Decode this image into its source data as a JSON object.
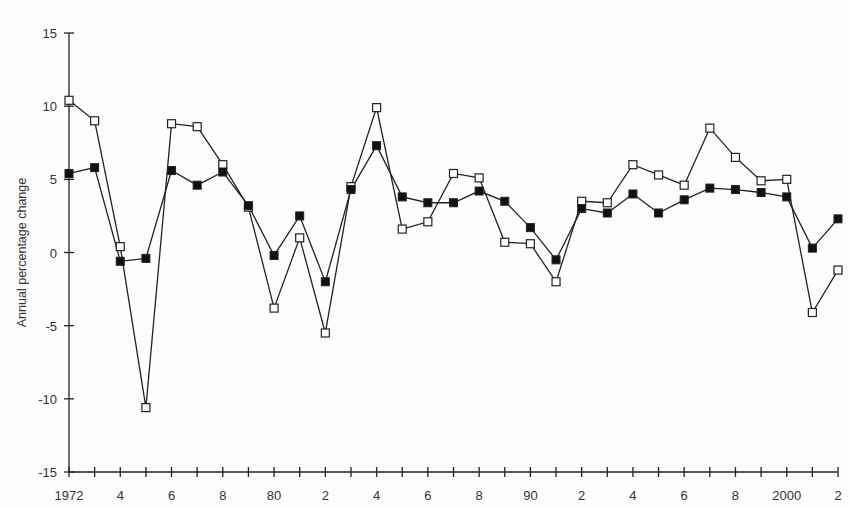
{
  "chart_data": {
    "type": "line",
    "title": "",
    "xlabel": "",
    "ylabel": "Annual percentage change",
    "x": [
      1972,
      1973,
      1974,
      1975,
      1976,
      1977,
      1978,
      1979,
      1980,
      1981,
      1982,
      1983,
      1984,
      1985,
      1986,
      1987,
      1988,
      1989,
      1990,
      1991,
      1992,
      1993,
      1994,
      1995,
      1996,
      1997,
      1998,
      1999,
      2000,
      2001,
      2002
    ],
    "xlim": [
      1972,
      2002
    ],
    "ylim": [
      -15,
      15
    ],
    "yticks": [
      15,
      10,
      5,
      0,
      -5,
      -10,
      -15
    ],
    "ytick_labels": [
      "15",
      "10",
      "5",
      "0",
      "-5",
      "-10",
      "-15"
    ],
    "xtick_labels": [
      {
        "x": 1972,
        "label": "1972"
      },
      {
        "x": 1974,
        "label": "4"
      },
      {
        "x": 1976,
        "label": "6"
      },
      {
        "x": 1978,
        "label": "8"
      },
      {
        "x": 1980,
        "label": "80"
      },
      {
        "x": 1982,
        "label": "2"
      },
      {
        "x": 1984,
        "label": "4"
      },
      {
        "x": 1986,
        "label": "6"
      },
      {
        "x": 1988,
        "label": "8"
      },
      {
        "x": 1990,
        "label": "90"
      },
      {
        "x": 1992,
        "label": "2"
      },
      {
        "x": 1994,
        "label": "4"
      },
      {
        "x": 1996,
        "label": "6"
      },
      {
        "x": 1998,
        "label": "8"
      },
      {
        "x": 2000,
        "label": "2000"
      },
      {
        "x": 2002,
        "label": "2"
      }
    ],
    "grid": false,
    "legend": "none",
    "series": [
      {
        "name": "Series A (filled squares)",
        "marker": "filled-square",
        "values": [
          5.4,
          5.8,
          -0.6,
          -0.4,
          5.6,
          4.6,
          5.5,
          3.2,
          -0.2,
          2.5,
          -2.0,
          4.3,
          7.3,
          3.8,
          3.4,
          3.4,
          4.2,
          3.5,
          1.7,
          -0.5,
          3.0,
          2.7,
          4.0,
          2.7,
          3.6,
          4.4,
          4.3,
          4.1,
          3.8,
          0.3,
          2.3
        ]
      },
      {
        "name": "Series B (open squares)",
        "marker": "open-square",
        "values": [
          10.4,
          9.0,
          0.4,
          -10.6,
          8.8,
          8.6,
          6.0,
          3.1,
          -3.8,
          1.0,
          -5.5,
          4.5,
          9.9,
          1.6,
          2.1,
          5.4,
          5.1,
          0.7,
          0.6,
          -2.0,
          3.5,
          3.4,
          6.0,
          5.3,
          4.6,
          8.5,
          6.5,
          4.9,
          5.0,
          -4.1,
          -1.2
        ]
      }
    ]
  }
}
